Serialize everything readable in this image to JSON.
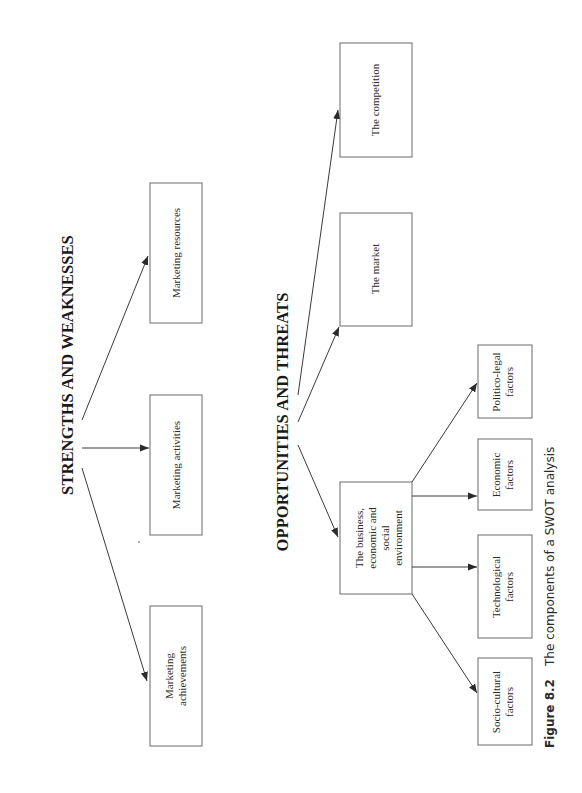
{
  "diagram": {
    "orientation": "rotated-90-ccw",
    "sections": {
      "strengths_weaknesses": {
        "heading": "STRENGTHS AND WEAKNESSES",
        "nodes": [
          {
            "id": "marketing-resources",
            "lines": [
              "Marketing resources"
            ]
          },
          {
            "id": "marketing-activities",
            "lines": [
              "Marketing activities"
            ]
          },
          {
            "id": "marketing-achievements",
            "lines": [
              "Marketing",
              "achievements"
            ]
          }
        ]
      },
      "opportunities_threats": {
        "heading": "OPPORTUNITIES AND THREATS",
        "nodes": [
          {
            "id": "the-competition",
            "lines": [
              "The competition"
            ]
          },
          {
            "id": "the-market",
            "lines": [
              "The market"
            ]
          },
          {
            "id": "business-environment",
            "lines": [
              "The business,",
              "economic and",
              "social",
              "environment"
            ]
          }
        ],
        "sub_nodes": [
          {
            "id": "politico-legal",
            "lines": [
              "Politico-legal",
              "factors"
            ]
          },
          {
            "id": "economic",
            "lines": [
              "Economic",
              "factors"
            ]
          },
          {
            "id": "technological",
            "lines": [
              "Technological",
              "factors"
            ]
          },
          {
            "id": "socio-cultural",
            "lines": [
              "Socio-cultural",
              "factors"
            ]
          }
        ]
      }
    },
    "edges": [
      {
        "from": "STRENGTHS AND WEAKNESSES",
        "to": "Marketing resources"
      },
      {
        "from": "STRENGTHS AND WEAKNESSES",
        "to": "Marketing activities"
      },
      {
        "from": "STRENGTHS AND WEAKNESSES",
        "to": "Marketing achievements"
      },
      {
        "from": "OPPORTUNITIES AND THREATS",
        "to": "The competition"
      },
      {
        "from": "OPPORTUNITIES AND THREATS",
        "to": "The market"
      },
      {
        "from": "OPPORTUNITIES AND THREATS",
        "to": "The business, economic and social environment"
      },
      {
        "from": "The business, economic and social environment",
        "to": "Politico-legal factors"
      },
      {
        "from": "The business, economic and social environment",
        "to": "Economic factors"
      },
      {
        "from": "The business, economic and social environment",
        "to": "Technological factors"
      },
      {
        "from": "The business, economic and social environment",
        "to": "Socio-cultural factors"
      }
    ]
  },
  "caption": {
    "number": "Figure 8.2",
    "text": "The components of a SWOT analysis"
  },
  "colors": {
    "background": "#ffffff",
    "box_stroke": "#6b6b6b",
    "line": "#3a3a3a",
    "text": "#1a1a1a"
  }
}
